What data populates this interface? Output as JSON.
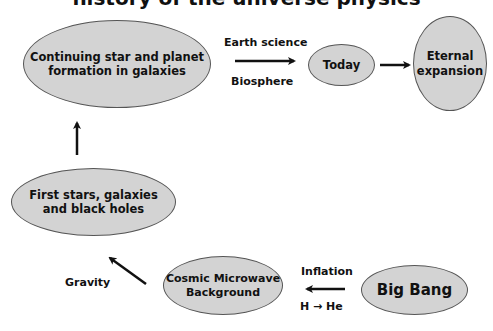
{
  "diagram": {
    "title_fragment": "history of the universe physics",
    "nodes": [
      {
        "id": "continuing-star-planet",
        "label_lines": [
          "Continuing star and planet",
          "formation in galaxies"
        ]
      },
      {
        "id": "today",
        "label_lines": [
          "Today"
        ]
      },
      {
        "id": "eternal-expansion",
        "label_lines": [
          "Eternal",
          "expansion"
        ]
      },
      {
        "id": "first-stars",
        "label_lines": [
          "First stars, galaxies",
          "and black holes"
        ]
      },
      {
        "id": "cmb",
        "label_lines": [
          "Cosmic Microwave",
          "Background"
        ]
      },
      {
        "id": "big-bang",
        "label_lines": [
          "Big Bang"
        ]
      }
    ],
    "edge_labels": {
      "earth_science": "Earth science",
      "biosphere": "Biosphere",
      "gravity": "Gravity",
      "inflation": "Inflation",
      "h_to_he": "H → He"
    },
    "edges": [
      {
        "from": "big-bang",
        "to": "cmb",
        "labels": [
          "Inflation",
          "H → He"
        ]
      },
      {
        "from": "cmb",
        "to": "first-stars",
        "labels": [
          "Gravity"
        ]
      },
      {
        "from": "first-stars",
        "to": "continuing-star-planet",
        "labels": []
      },
      {
        "from": "continuing-star-planet",
        "to": "today",
        "labels": [
          "Earth science",
          "Biosphere"
        ]
      },
      {
        "from": "today",
        "to": "eternal-expansion",
        "labels": []
      }
    ],
    "colors": {
      "node_fill": "#d3d3d3",
      "node_stroke": "#555555",
      "arrow": "#111111"
    }
  }
}
